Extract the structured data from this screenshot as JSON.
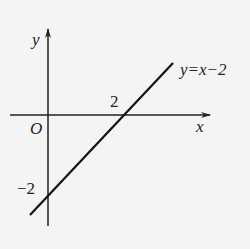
{
  "figure": {
    "type": "coordinate-graph",
    "axes": {
      "x_label": "x",
      "y_label": "y",
      "origin_label": "O"
    },
    "line": {
      "equation_label": "y=x−2",
      "x_intercept_label": "2",
      "y_intercept_label": "−2"
    },
    "colors": {
      "background": "#f4f4f4",
      "ink": "#222222"
    }
  }
}
